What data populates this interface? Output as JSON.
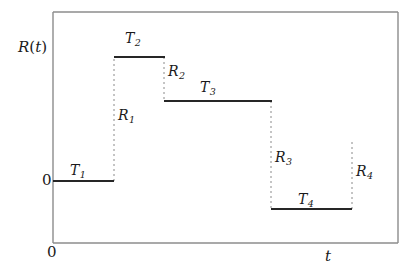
{
  "figure": {
    "title": "",
    "background": "#ffffff",
    "width": 417,
    "height": 275
  },
  "axes": {
    "y_axis_label": "R(t)",
    "y_axis_label_parts": {
      "base": "R",
      "open": "(",
      "arg": "t",
      "close": ")"
    },
    "x_axis_label": "t",
    "y_origin_label": "0",
    "x_origin_label": "0",
    "frame_color": "#8c8c8c",
    "frame_left": 53,
    "frame_right": 398,
    "frame_top": 12,
    "frame_bottom": 243
  },
  "style": {
    "step_line_color": "#262626",
    "step_line_width": 2,
    "jump_line_color": "#8a8a8a",
    "jump_line_width": 1,
    "jump_dash": "2 3",
    "label_color": "#1a1a1a"
  },
  "labels": {
    "T1": {
      "base": "T",
      "sub": "1"
    },
    "T2": {
      "base": "T",
      "sub": "2"
    },
    "T3": {
      "base": "T",
      "sub": "3"
    },
    "T4": {
      "base": "T",
      "sub": "4"
    },
    "R1": {
      "base": "R",
      "sub": "1"
    },
    "R2": {
      "base": "R",
      "sub": "2"
    },
    "R3": {
      "base": "R",
      "sub": "3"
    },
    "R4": {
      "base": "R",
      "sub": "4"
    }
  },
  "chart_data": {
    "type": "line",
    "title": "",
    "xlabel": "t",
    "ylabel": "R(t)",
    "grid": false,
    "legend": null,
    "xlim": [
      53,
      398
    ],
    "ylim_pixels": [
      243,
      12
    ],
    "baseline_y": 181,
    "segments": [
      {
        "name": "T1",
        "x_start": 53,
        "x_end": 114,
        "y": 181,
        "label_x": 70,
        "label_y": 163
      },
      {
        "name": "T2",
        "x_start": 114,
        "x_end": 165,
        "y": 57,
        "label_x": 125,
        "label_y": 31
      },
      {
        "name": "T3",
        "x_start": 164,
        "x_end": 272,
        "y": 101,
        "label_x": 200,
        "label_y": 80
      },
      {
        "name": "T4",
        "x_start": 271,
        "x_end": 352,
        "y": 209,
        "label_x": 298,
        "label_y": 192
      }
    ],
    "jumps": [
      {
        "name": "R1",
        "x": 114,
        "y_start": 181,
        "y_end": 57,
        "direction": "up",
        "label_x": 118,
        "label_y": 108
      },
      {
        "name": "R2",
        "x": 164,
        "y_start": 57,
        "y_end": 101,
        "direction": "down",
        "label_x": 168,
        "label_y": 64
      },
      {
        "name": "R3",
        "x": 271,
        "y_start": 101,
        "y_end": 209,
        "direction": "down",
        "label_x": 275,
        "label_y": 150
      },
      {
        "name": "R4",
        "x": 352,
        "y_start": 142,
        "y_end": 209,
        "direction": "up",
        "label_x": 356,
        "label_y": 164
      }
    ]
  }
}
